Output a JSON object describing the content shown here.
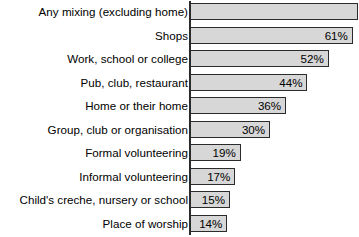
{
  "chart_data": {
    "type": "bar",
    "orientation": "horizontal",
    "title": "",
    "subtitle": "",
    "xlabel": "",
    "ylabel": "",
    "xlim": [
      0,
      63
    ],
    "grid": false,
    "legend": null,
    "value_suffix": "%",
    "categories": [
      "Any mixing (excluding home)",
      "Shops",
      "Work, school or college",
      "Pub, club, restaurant",
      "Home or their home",
      "Group, club or organisation",
      "Formal volunteering",
      "Informal volunteering",
      "Child's creche, nursery or school",
      "Place of worship"
    ],
    "values": [
      63,
      61,
      52,
      44,
      36,
      30,
      19,
      17,
      15,
      14
    ],
    "value_labels": [
      "",
      "61%",
      "52%",
      "44%",
      "36%",
      "30%",
      "19%",
      "17%",
      "15%",
      "14%"
    ],
    "colors": {
      "bar_fill": "#d7d7d7",
      "bar_border": "#2b2b2b",
      "text": "#000000",
      "background": "#ffffff",
      "axis": "#2b2b2b"
    }
  },
  "rows": [
    {
      "label": "Any mixing (excluding home)",
      "value": 63,
      "value_label": ""
    },
    {
      "label": "Shops",
      "value": 61,
      "value_label": "61%"
    },
    {
      "label": "Work, school or college",
      "value": 52,
      "value_label": "52%"
    },
    {
      "label": "Pub, club, restaurant",
      "value": 44,
      "value_label": "44%"
    },
    {
      "label": "Home or their home",
      "value": 36,
      "value_label": "36%"
    },
    {
      "label": "Group, club or organisation",
      "value": 30,
      "value_label": "30%"
    },
    {
      "label": "Formal volunteering",
      "value": 19,
      "value_label": "19%"
    },
    {
      "label": "Informal volunteering",
      "value": 17,
      "value_label": "17%"
    },
    {
      "label": "Child's creche, nursery or school",
      "value": 15,
      "value_label": "15%"
    },
    {
      "label": "Place of worship",
      "value": 14,
      "value_label": "14%"
    }
  ]
}
